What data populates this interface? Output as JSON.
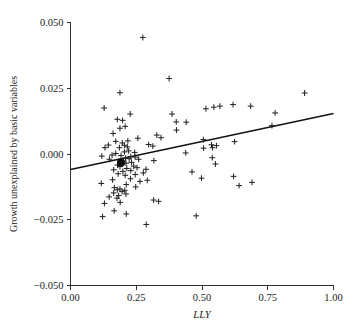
{
  "chart_data": {
    "type": "scatter",
    "title": "",
    "xlabel": "LLY",
    "ylabel": "Growth unexplained by basic variables",
    "xlim": [
      0.0,
      1.0
    ],
    "ylim": [
      -0.05,
      0.05
    ],
    "xticks": [
      "0.00",
      "0.25",
      "0.50",
      "0.75",
      "1.00"
    ],
    "xtick_values": [
      0.0,
      0.25,
      0.5,
      0.75,
      1.0
    ],
    "yticks": [
      "0.050",
      "0.025",
      "0.000",
      "-0.025",
      "-0.050"
    ],
    "ytick_values": [
      0.05,
      0.025,
      0.0,
      -0.025,
      -0.05
    ],
    "grid": false,
    "legend": "none",
    "series": [
      {
        "name": "observations",
        "marker": "plus",
        "points": [
          [
            0.275,
            0.0443
          ],
          [
            0.375,
            0.0287
          ],
          [
            0.188,
            0.0233
          ],
          [
            0.89,
            0.0232
          ],
          [
            0.128,
            0.0175
          ],
          [
            0.515,
            0.0172
          ],
          [
            0.568,
            0.0182
          ],
          [
            0.618,
            0.0188
          ],
          [
            0.545,
            0.0178
          ],
          [
            0.685,
            0.0182
          ],
          [
            0.227,
            0.0152
          ],
          [
            0.778,
            0.0156
          ],
          [
            0.386,
            0.0152
          ],
          [
            0.178,
            0.0132
          ],
          [
            0.198,
            0.0128
          ],
          [
            0.402,
            0.0122
          ],
          [
            0.44,
            0.0121
          ],
          [
            0.208,
            0.0105
          ],
          [
            0.188,
            0.0098
          ],
          [
            0.403,
            0.0091
          ],
          [
            0.766,
            0.0108
          ],
          [
            0.162,
            0.0078
          ],
          [
            0.328,
            0.0072
          ],
          [
            0.256,
            0.006
          ],
          [
            0.344,
            0.0062
          ],
          [
            0.505,
            0.0055
          ],
          [
            0.218,
            0.005
          ],
          [
            0.172,
            0.0048
          ],
          [
            0.624,
            0.0047
          ],
          [
            0.197,
            0.0042
          ],
          [
            0.144,
            0.0034
          ],
          [
            0.205,
            0.0033
          ],
          [
            0.297,
            0.0036
          ],
          [
            0.536,
            0.0035
          ],
          [
            0.555,
            0.0032
          ],
          [
            0.313,
            0.003
          ],
          [
            0.216,
            0.0027
          ],
          [
            0.186,
            0.0024
          ],
          [
            0.54,
            0.0024
          ],
          [
            0.131,
            0.0024
          ],
          [
            0.506,
            0.0022
          ],
          [
            0.221,
            0.0012
          ],
          [
            0.205,
            0.0008
          ],
          [
            0.244,
            0.0006
          ],
          [
            0.438,
            0.0004
          ],
          [
            0.172,
            0.0002
          ],
          [
            0.158,
            -0.0004
          ],
          [
            0.192,
            -0.0006
          ],
          [
            0.119,
            -0.0008
          ],
          [
            0.229,
            -0.001
          ],
          [
            0.246,
            -0.0012
          ],
          [
            0.539,
            -0.0014
          ],
          [
            0.209,
            -0.0016
          ],
          [
            0.223,
            -0.0018
          ],
          [
            0.148,
            -0.002
          ],
          [
            0.259,
            -0.002
          ],
          [
            0.317,
            -0.0025
          ],
          [
            0.199,
            -0.003
          ],
          [
            0.232,
            -0.0032
          ],
          [
            0.211,
            -0.0035
          ],
          [
            0.551,
            -0.0038
          ],
          [
            0.179,
            -0.0042
          ],
          [
            0.24,
            -0.0046
          ],
          [
            0.188,
            -0.0048
          ],
          [
            0.253,
            -0.0052
          ],
          [
            0.214,
            -0.0055
          ],
          [
            0.287,
            -0.0058
          ],
          [
            0.164,
            -0.006
          ],
          [
            0.229,
            -0.0063
          ],
          [
            0.199,
            -0.0066
          ],
          [
            0.462,
            -0.0068
          ],
          [
            0.277,
            -0.0072
          ],
          [
            0.181,
            -0.0075
          ],
          [
            0.246,
            -0.0078
          ],
          [
            0.208,
            -0.0081
          ],
          [
            0.62,
            -0.0085
          ],
          [
            0.498,
            -0.0092
          ],
          [
            0.228,
            -0.0094
          ],
          [
            0.16,
            -0.0098
          ],
          [
            0.292,
            -0.01
          ],
          [
            0.264,
            -0.0104
          ],
          [
            0.69,
            -0.0108
          ],
          [
            0.117,
            -0.0112
          ],
          [
            0.212,
            -0.0116
          ],
          [
            0.641,
            -0.012
          ],
          [
            0.248,
            -0.0125
          ],
          [
            0.167,
            -0.0128
          ],
          [
            0.188,
            -0.0133
          ],
          [
            0.178,
            -0.0136
          ],
          [
            0.206,
            -0.0138
          ],
          [
            0.196,
            -0.0143
          ],
          [
            0.164,
            -0.0148
          ],
          [
            0.211,
            -0.0152
          ],
          [
            0.183,
            -0.0158
          ],
          [
            0.147,
            -0.0163
          ],
          [
            0.177,
            -0.0168
          ],
          [
            0.316,
            -0.0175
          ],
          [
            0.335,
            -0.018
          ],
          [
            0.189,
            -0.0184
          ],
          [
            0.129,
            -0.0188
          ],
          [
            0.166,
            -0.0216
          ],
          [
            0.212,
            -0.0228
          ],
          [
            0.478,
            -0.0235
          ],
          [
            0.122,
            -0.0238
          ],
          [
            0.288,
            -0.0268
          ]
        ]
      },
      {
        "name": "highlighted-observation",
        "marker": "filled-circle",
        "points": [
          [
            0.192,
            -0.0033
          ]
        ]
      }
    ],
    "fit_line": {
      "name": "regression-line",
      "x": [
        0.0,
        1.0
      ],
      "y": [
        -0.0059,
        0.0154
      ]
    }
  }
}
